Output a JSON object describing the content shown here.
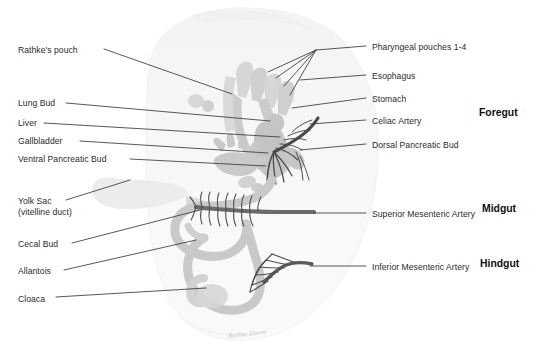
{
  "figure": {
    "signature": "Rathke Dawn"
  },
  "colors": {
    "body_silhouette": "#f4f4f4",
    "gut_tube": "#c9c9c9",
    "gut_tube_light": "#dcdcdc",
    "yolk_sac": "#ececec",
    "artery_dark": "#4a4a4a",
    "leader_line": "#3a3a3a",
    "label_text": "#2b2b2b",
    "region_text": "#111111",
    "background": "#ffffff"
  },
  "labels_left": [
    {
      "id": "rathkes-pouch",
      "text": "Rathke's pouch",
      "x": 18,
      "y": 45,
      "line": [
        104,
        49,
        232,
        94
      ]
    },
    {
      "id": "lung-bud",
      "text": "Lung Bud",
      "x": 18,
      "y": 98,
      "line": [
        66,
        103,
        270,
        121
      ]
    },
    {
      "id": "liver",
      "text": "Liver",
      "x": 18,
      "y": 118,
      "line": [
        44,
        123,
        280,
        137
      ]
    },
    {
      "id": "gallbladder",
      "text": "Gallbladder",
      "x": 18,
      "y": 136,
      "line": [
        80,
        141,
        268,
        153
      ]
    },
    {
      "id": "ventral-pancreatic-bud",
      "text": "Ventral Pancreatic Bud",
      "x": 18,
      "y": 154,
      "line": [
        130,
        159,
        266,
        166
      ]
    },
    {
      "id": "yolk-sac",
      "text": "Yolk Sac",
      "x": 18,
      "y": 196,
      "line": [
        66,
        200,
        130,
        180
      ],
      "text2": "(vitelline duct)",
      "y2": 206
    },
    {
      "id": "cecal-bud",
      "text": "Cecal Bud",
      "x": 18,
      "y": 239,
      "line": [
        72,
        243,
        200,
        210
      ]
    },
    {
      "id": "allantois",
      "text": "Allantois",
      "x": 18,
      "y": 266,
      "line": [
        64,
        270,
        196,
        240
      ]
    },
    {
      "id": "cloaca",
      "text": "Cloaca",
      "x": 18,
      "y": 294,
      "line": [
        56,
        297,
        206,
        288
      ]
    }
  ],
  "labels_right": [
    {
      "id": "pharyngeal-pouches",
      "text": "Pharyngeal pouches 1-4",
      "x": 372,
      "y": 42,
      "line": [
        366,
        46,
        316,
        50
      ]
    },
    {
      "id": "esophagus",
      "text": "Esophagus",
      "x": 372,
      "y": 71,
      "line": [
        366,
        75,
        300,
        80
      ]
    },
    {
      "id": "stomach",
      "text": "Stomach",
      "x": 372,
      "y": 94,
      "line": [
        366,
        98,
        292,
        108
      ]
    },
    {
      "id": "celiac-artery",
      "text": "Celiac Artery",
      "x": 372,
      "y": 116,
      "line": [
        366,
        120,
        310,
        124
      ]
    },
    {
      "id": "dorsal-pancreatic-bud",
      "text": "Dorsal Pancreatic Bud",
      "x": 372,
      "y": 140,
      "line": [
        366,
        144,
        300,
        150
      ]
    },
    {
      "id": "superior-mesenteric-artery",
      "text": "Superior Mesenteric Artery",
      "x": 372,
      "y": 209,
      "line": [
        366,
        213,
        314,
        213
      ]
    },
    {
      "id": "inferior-mesenteric-artery",
      "text": "Inferior Mesenteric Artery",
      "x": 372,
      "y": 262,
      "line": [
        366,
        266,
        310,
        266
      ]
    }
  ],
  "pharyngeal_pouch_lines": [
    [
      316,
      50,
      268,
      72
    ],
    [
      316,
      50,
      276,
      78
    ],
    [
      316,
      50,
      284,
      86
    ],
    [
      316,
      50,
      290,
      95
    ]
  ],
  "regions": [
    {
      "id": "foregut",
      "text": "Foregut",
      "x": 479,
      "y": 107
    },
    {
      "id": "midgut",
      "text": "Midgut",
      "x": 482,
      "y": 203
    },
    {
      "id": "hindgut",
      "text": "Hindgut",
      "x": 480,
      "y": 258
    }
  ]
}
